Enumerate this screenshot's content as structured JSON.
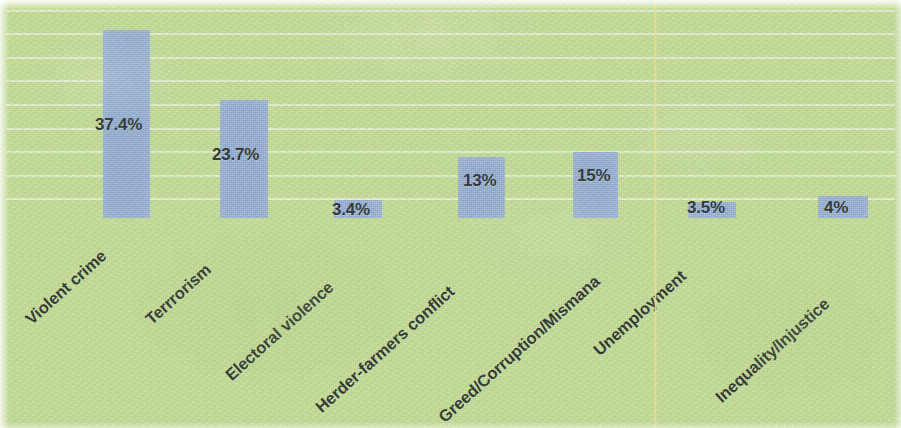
{
  "chart_data": {
    "type": "bar",
    "title": "",
    "subtitle": "",
    "xlabel": "",
    "ylabel": "",
    "categories": [
      "Violent crime",
      "Terrrorism",
      "Electoral violence",
      "Herder-farmers conflict",
      "Greed/Corruption/Mismana",
      "Unemployment",
      "Inequality/Injustice"
    ],
    "values": [
      37.4,
      23.7,
      3.4,
      13,
      15,
      3.5,
      4
    ],
    "value_labels": [
      "37.4%",
      "23.7%",
      "3.4%",
      "13%",
      "15%",
      "3.5%",
      "4%"
    ],
    "ylim": [
      0,
      45
    ],
    "grid": true,
    "gridlines": 9,
    "legend": "none",
    "legend_position": "none",
    "series": [
      {
        "name": "",
        "values": [
          37.4,
          23.7,
          3.4,
          13,
          15,
          3.5,
          4
        ]
      }
    ]
  },
  "style": {
    "background_color": "#c5de96",
    "bar_color": "#8faade",
    "gridline_color": "#ffffff",
    "label_color": "#14181c",
    "crease_color": "#e8dc87"
  },
  "geometry": {
    "baseline_y": 218,
    "bars": [
      {
        "x": 103,
        "y": 30,
        "w": 47,
        "h": 188,
        "label_x": 95,
        "label_y": 115,
        "cat_x": 28,
        "cat_y": 312
      },
      {
        "x": 220,
        "y": 100,
        "w": 48,
        "h": 118,
        "label_x": 212,
        "label_y": 145,
        "cat_x": 148,
        "cat_y": 312
      },
      {
        "x": 334,
        "y": 200,
        "w": 48,
        "h": 18,
        "label_x": 332,
        "label_y": 200,
        "cat_x": 228,
        "cat_y": 368
      },
      {
        "x": 458,
        "y": 157,
        "w": 47,
        "h": 61,
        "label_x": 463,
        "label_y": 171,
        "cat_x": 318,
        "cat_y": 400
      },
      {
        "x": 573,
        "y": 152,
        "w": 45,
        "h": 66,
        "label_x": 577,
        "label_y": 166,
        "cat_x": 441,
        "cat_y": 410
      },
      {
        "x": 688,
        "y": 202,
        "w": 48,
        "h": 16,
        "label_x": 687,
        "label_y": 198,
        "cat_x": 596,
        "cat_y": 343
      },
      {
        "x": 818,
        "y": 196,
        "w": 50,
        "h": 22,
        "label_x": 824,
        "label_y": 198,
        "cat_x": 718,
        "cat_y": 390
      }
    ],
    "gridline_y": [
      10,
      33,
      57,
      80,
      104,
      128,
      151,
      175,
      198
    ],
    "crease_x": 654
  }
}
